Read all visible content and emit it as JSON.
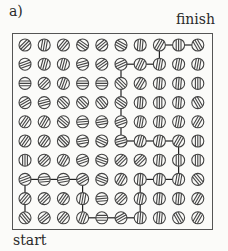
{
  "figure": {
    "panel_label": "a)",
    "finish_label": "finish",
    "start_label": "start"
  },
  "grid": {
    "rows": 10,
    "cols": 10,
    "origin_x": 25,
    "origin_y": 45,
    "spacing_x": 19.2,
    "spacing_y": 19.2,
    "dot_radius": 6,
    "stroke_color": "#444444",
    "path_color": "#222222",
    "angles": [
      [
        45,
        80,
        50,
        145,
        40,
        150,
        85,
        60,
        90,
        120
      ],
      [
        20,
        75,
        75,
        15,
        35,
        25,
        65,
        80,
        80,
        80
      ],
      [
        0,
        45,
        70,
        0,
        0,
        135,
        60,
        85,
        85,
        90
      ],
      [
        30,
        15,
        135,
        135,
        130,
        145,
        85,
        90,
        85,
        120
      ],
      [
        55,
        60,
        140,
        5,
        10,
        20,
        80,
        85,
        80,
        60
      ],
      [
        55,
        55,
        135,
        10,
        155,
        15,
        75,
        80,
        60,
        90
      ],
      [
        90,
        45,
        60,
        20,
        160,
        45,
        45,
        85,
        90,
        90
      ],
      [
        20,
        5,
        10,
        30,
        160,
        60,
        85,
        85,
        80,
        130
      ],
      [
        50,
        45,
        55,
        80,
        5,
        45,
        80,
        85,
        85,
        60
      ],
      [
        130,
        40,
        50,
        70,
        0,
        30,
        85,
        85,
        120,
        60
      ]
    ],
    "path": [
      [
        9,
        0
      ],
      [
        8,
        0
      ],
      [
        7,
        0
      ],
      [
        7,
        1
      ],
      [
        7,
        2
      ],
      [
        7,
        3
      ],
      [
        8,
        3
      ],
      [
        9,
        3
      ],
      [
        9,
        4
      ],
      [
        9,
        5
      ],
      [
        9,
        6
      ],
      [
        8,
        6
      ],
      [
        7,
        6
      ],
      [
        7,
        7
      ],
      [
        7,
        8
      ],
      [
        6,
        8
      ],
      [
        5,
        8
      ],
      [
        5,
        7
      ],
      [
        5,
        6
      ],
      [
        5,
        5
      ],
      [
        4,
        5
      ],
      [
        3,
        5
      ],
      [
        2,
        5
      ],
      [
        1,
        5
      ],
      [
        1,
        6
      ],
      [
        1,
        7
      ],
      [
        0,
        7
      ],
      [
        0,
        8
      ],
      [
        0,
        9
      ]
    ]
  }
}
